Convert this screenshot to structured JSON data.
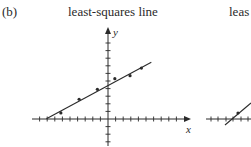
{
  "panel_label": "(b)",
  "titles": {
    "left": "least-squares line",
    "right_partial": "leas"
  },
  "axes": {
    "x_label": "x",
    "y_label": "y"
  },
  "colors": {
    "ink": "#2a2a2a",
    "background": "#ffffff"
  },
  "chart_data": [
    {
      "type": "scatter",
      "title": "least-squares line",
      "xlabel": "x",
      "ylabel": "y",
      "grid": false,
      "tick_labels": false,
      "xlim": [
        -11,
        10.5
      ],
      "ylim": [
        -3.5,
        12
      ],
      "points": [
        {
          "x": -6.2,
          "y": 0.8
        },
        {
          "x": -3.8,
          "y": 2.6
        },
        {
          "x": -1.4,
          "y": 3.9
        },
        {
          "x": 0.9,
          "y": 5.3
        },
        {
          "x": 2.9,
          "y": 5.7
        },
        {
          "x": 4.4,
          "y": 6.7
        }
      ],
      "fit_line": {
        "slope": 0.54,
        "intercept": 4.4,
        "x_start": -8.1,
        "x_end": 5.7
      }
    },
    {
      "type": "scatter",
      "title": "leas",
      "note": "partially visible panel cut off at right edge",
      "points": [
        {
          "x": 2.5,
          "y": 0.7
        }
      ]
    }
  ]
}
